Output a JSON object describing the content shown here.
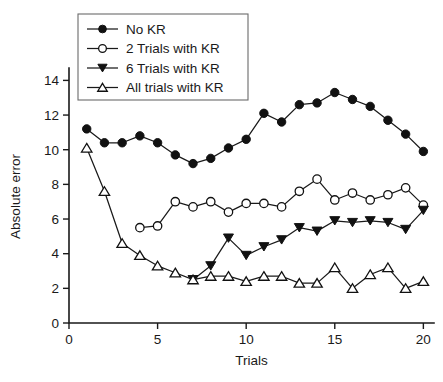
{
  "chart_data": {
    "type": "line",
    "title": "",
    "xlabel": "Trials",
    "ylabel": "Absolute error",
    "xlim": [
      0,
      20.6
    ],
    "ylim": [
      0,
      14.6
    ],
    "xticks": [
      0,
      5,
      10,
      15,
      20
    ],
    "yticks": [
      0,
      2,
      4,
      6,
      8,
      10,
      12,
      14
    ],
    "xtick_labels": [
      "0",
      "5",
      "10",
      "15",
      "20"
    ],
    "ytick_labels": [
      "0",
      "2",
      "4",
      "6",
      "8",
      "10",
      "12",
      "14"
    ],
    "grid": false,
    "legend_position": "top-left",
    "series": [
      {
        "name": "No KR",
        "marker": "filled-circle",
        "color": "#111111",
        "x": [
          1,
          2,
          3,
          4,
          5,
          6,
          7,
          8,
          9,
          10,
          11,
          12,
          13,
          14,
          15,
          16,
          17,
          18,
          19,
          20
        ],
        "values": [
          11.2,
          10.4,
          10.4,
          10.8,
          10.4,
          9.7,
          9.2,
          9.5,
          10.1,
          10.6,
          12.1,
          11.6,
          12.6,
          12.7,
          13.3,
          12.9,
          12.5,
          11.7,
          10.9,
          9.9
        ]
      },
      {
        "name": "2 Trials with KR",
        "marker": "open-circle",
        "color": "#111111",
        "x": [
          4,
          5,
          6,
          7,
          8,
          9,
          10,
          11,
          12,
          13,
          14,
          15,
          16,
          17,
          18,
          19,
          20
        ],
        "values": [
          5.5,
          5.6,
          7.0,
          6.7,
          7.0,
          6.4,
          6.9,
          6.9,
          6.7,
          7.6,
          8.3,
          7.1,
          7.5,
          7.1,
          7.4,
          7.8,
          6.8
        ]
      },
      {
        "name": "6 Trials with KR",
        "marker": "filled-triangle",
        "color": "#111111",
        "x": [
          7,
          8,
          9,
          10,
          11,
          12,
          13,
          14,
          15,
          16,
          17,
          18,
          19,
          20
        ],
        "values": [
          2.5,
          3.3,
          4.9,
          3.9,
          4.4,
          4.8,
          5.5,
          5.3,
          5.9,
          5.8,
          5.9,
          5.8,
          5.4,
          6.5
        ]
      },
      {
        "name": "All trials with KR",
        "marker": "open-triangle",
        "color": "#111111",
        "x": [
          1,
          2,
          3,
          4,
          5,
          6,
          7,
          8,
          9,
          10,
          11,
          12,
          13,
          14,
          15,
          16,
          17,
          18,
          19,
          20
        ],
        "values": [
          10.1,
          7.6,
          4.6,
          3.9,
          3.3,
          2.9,
          2.5,
          2.7,
          2.7,
          2.4,
          2.7,
          2.7,
          2.3,
          2.3,
          3.2,
          2.0,
          2.8,
          3.2,
          2.0,
          2.4
        ]
      }
    ]
  },
  "legend": {
    "items": [
      {
        "label": "No KR"
      },
      {
        "label": "2 Trials with KR"
      },
      {
        "label": "6 Trials with KR"
      },
      {
        "label": "All trials with KR"
      }
    ]
  }
}
